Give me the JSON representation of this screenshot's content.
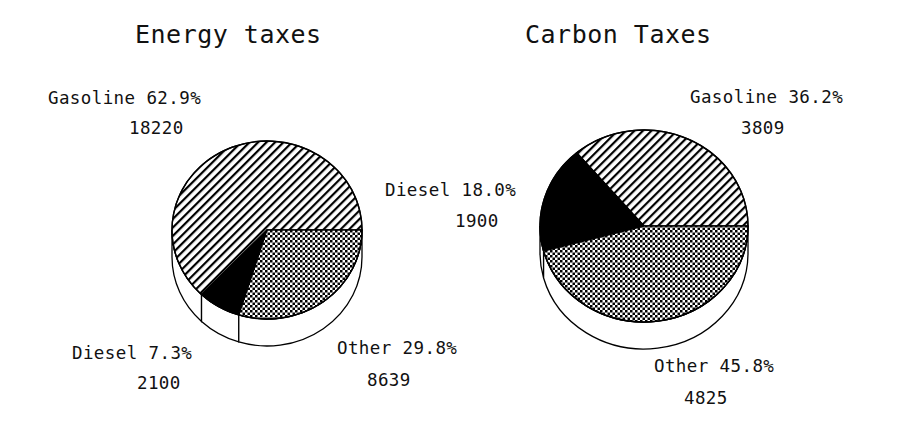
{
  "figure": {
    "background": "#ffffff",
    "ink": "#000000"
  },
  "charts": [
    {
      "id": "energy-taxes",
      "title": "Energy taxes",
      "title_pos": {
        "x": 135,
        "y": 25
      },
      "center": {
        "x": 267,
        "y": 230
      },
      "radius_x": 95,
      "radius_y": 89,
      "depth": 27,
      "labels": [
        {
          "key": "gasoline",
          "pct": "Gasoline 62.9%",
          "value": "18220",
          "pct_pos": {
            "x": 48,
            "y": 88
          },
          "val_pos": {
            "x": 129,
            "y": 118
          }
        },
        {
          "key": "diesel",
          "pct": "Diesel 7.3%",
          "value": "2100",
          "pct_pos": {
            "x": 72,
            "y": 343
          },
          "val_pos": {
            "x": 137,
            "y": 373
          }
        },
        {
          "key": "other",
          "pct": "Other 29.8%",
          "value": "8639",
          "pct_pos": {
            "x": 337,
            "y": 338
          },
          "val_pos": {
            "x": 367,
            "y": 370
          }
        }
      ]
    },
    {
      "id": "carbon-taxes",
      "title": "Carbon Taxes",
      "title_pos": {
        "x": 525,
        "y": 25
      },
      "center": {
        "x": 644,
        "y": 226
      },
      "radius_x": 104,
      "radius_y": 96,
      "depth": 27,
      "labels": [
        {
          "key": "gasoline",
          "pct": "Gasoline 36.2%",
          "value": "3809",
          "pct_pos": {
            "x": 690,
            "y": 87
          },
          "val_pos": {
            "x": 741,
            "y": 118
          }
        },
        {
          "key": "diesel",
          "pct": "Diesel 18.0%",
          "value": "1900",
          "pct_pos": {
            "x": 385,
            "y": 180
          },
          "val_pos": {
            "x": 455,
            "y": 211
          }
        },
        {
          "key": "other",
          "pct": "Other 45.8%",
          "value": "4825",
          "pct_pos": {
            "x": 654,
            "y": 356
          },
          "val_pos": {
            "x": 684,
            "y": 388
          }
        }
      ]
    }
  ],
  "chart_data": [
    {
      "type": "pie",
      "title": "Energy taxes",
      "categories": [
        "Gasoline",
        "Diesel",
        "Other"
      ],
      "values": [
        18220,
        2100,
        8639
      ],
      "percentages": [
        62.9,
        7.3,
        29.8
      ],
      "labels": [
        "Gasoline 62.9%",
        "Diesel 7.3%",
        "Other 29.8%"
      ],
      "value_labels": [
        "18220",
        "2100",
        "8639"
      ],
      "fills": [
        "diagonal-hatch",
        "solid-black",
        "checker"
      ],
      "three_d": true,
      "start_angle_deg": 0,
      "direction": "counterclockwise",
      "legend": "none"
    },
    {
      "type": "pie",
      "title": "Carbon Taxes",
      "categories": [
        "Gasoline",
        "Diesel",
        "Other"
      ],
      "values": [
        3809,
        1900,
        4825
      ],
      "percentages": [
        36.2,
        18.0,
        45.8
      ],
      "labels": [
        "Gasoline 36.2%",
        "Diesel 18.0%",
        "Other 45.8%"
      ],
      "value_labels": [
        "3809",
        "1900",
        "4825"
      ],
      "fills": [
        "diagonal-hatch",
        "solid-black",
        "checker"
      ],
      "three_d": true,
      "start_angle_deg": 0,
      "direction": "counterclockwise",
      "legend": "none"
    }
  ]
}
